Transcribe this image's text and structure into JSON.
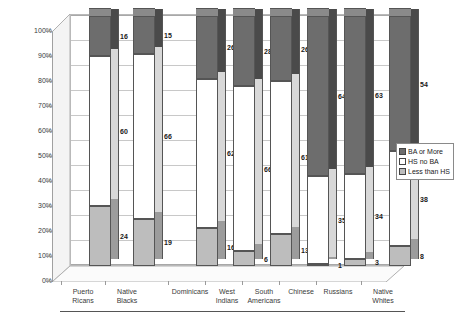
{
  "chart_data": {
    "type": "bar",
    "title": "",
    "subtitle": "",
    "xlabel": "",
    "ylabel": "",
    "ylim": [
      0,
      100
    ],
    "stacked": true,
    "stack_mode": "percent",
    "grid": true,
    "legend_position": "right",
    "tick_labels": [
      "100%",
      "90%",
      "80%",
      "70%",
      "60%",
      "50%",
      "40%",
      "30%",
      "20%",
      "10%",
      "0%"
    ],
    "tick_values": [
      100,
      90,
      80,
      70,
      60,
      50,
      40,
      30,
      20,
      10,
      0
    ],
    "categories": [
      "Puerto Ricans",
      "Native Blacks",
      "Dominicans",
      "West Indians",
      "South Americans",
      "Chinese",
      "Russians",
      "Native Whites"
    ],
    "category_lines": [
      [
        "Puerto",
        "Ricans"
      ],
      [
        "Native",
        "Blacks"
      ],
      [
        "Dominicans",
        ""
      ],
      [
        "West",
        "Indians"
      ],
      [
        "South",
        "Americans"
      ],
      [
        "Chinese",
        ""
      ],
      [
        "Russians",
        ""
      ],
      [
        "Native",
        "Whites"
      ]
    ],
    "series": [
      {
        "name": "BA or More",
        "color": "#6d6d6d",
        "values": [
          16,
          15,
          26,
          28,
          26,
          64,
          63,
          54
        ]
      },
      {
        "name": "HS no BA",
        "color": "#ffffff",
        "values": [
          60,
          66,
          62,
          66,
          61,
          35,
          34,
          38
        ]
      },
      {
        "name": "Less than HS",
        "color": "#bdbdbd",
        "values": [
          24,
          19,
          16,
          6,
          13,
          1,
          3,
          8
        ]
      }
    ]
  },
  "legend": {
    "items": [
      {
        "label": "BA or More",
        "swatch": "sw0"
      },
      {
        "label": "HS no BA",
        "swatch": "sw1"
      },
      {
        "label": "Less than HS",
        "swatch": "sw2"
      }
    ]
  }
}
